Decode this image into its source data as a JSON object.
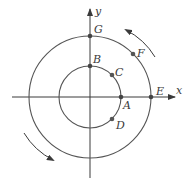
{
  "diagram": {
    "type": "concentric-circles-rotation",
    "axes": {
      "x_label": "x",
      "y_label": "y",
      "color": "#3a3a3a"
    },
    "circles": {
      "inner": {
        "stroke": "#555555",
        "radius": 31
      },
      "outer": {
        "stroke": "#555555",
        "radius": 61
      }
    },
    "points": [
      {
        "id": "A",
        "label": "A",
        "circle": "inner",
        "angle_deg": 0
      },
      {
        "id": "B",
        "label": "B",
        "circle": "inner",
        "angle_deg": 90
      },
      {
        "id": "C",
        "label": "C",
        "circle": "inner",
        "angle_deg": 45
      },
      {
        "id": "D",
        "label": "D",
        "circle": "inner",
        "angle_deg": -45
      },
      {
        "id": "E",
        "label": "E",
        "circle": "outer",
        "angle_deg": 0
      },
      {
        "id": "F",
        "label": "F",
        "circle": "outer",
        "angle_deg": 45
      },
      {
        "id": "G",
        "label": "G",
        "circle": "outer",
        "angle_deg": 90
      }
    ],
    "arrows": [
      {
        "name": "counterclockwise-arrow-upper-right",
        "direction": "counterclockwise"
      },
      {
        "name": "counterclockwise-arrow-lower-left",
        "direction": "counterclockwise"
      }
    ]
  }
}
